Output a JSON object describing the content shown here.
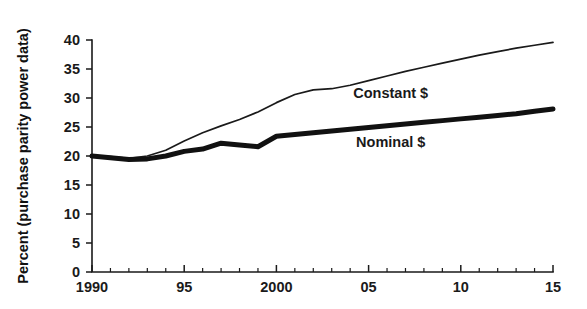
{
  "chart_data": {
    "type": "line",
    "title": "",
    "xlabel": "",
    "ylabel": "Percent (purchase parity power data)",
    "xlim": [
      1990,
      2015
    ],
    "ylim": [
      0,
      40
    ],
    "grid": false,
    "legend_position": "inline-annotation",
    "y_ticks": [
      0,
      5,
      10,
      15,
      20,
      25,
      30,
      35,
      40
    ],
    "y_tick_labels": [
      "0",
      "5",
      "10",
      "15",
      "20",
      "25",
      "30",
      "35",
      "40"
    ],
    "x_ticks": [
      1990,
      1995,
      2000,
      2005,
      2010,
      2015
    ],
    "x_tick_labels": [
      "1990",
      "95",
      "2000",
      "05",
      "10",
      "15"
    ],
    "x_minor_tick_step": 1,
    "x": [
      1990,
      1991,
      1992,
      1993,
      1994,
      1995,
      1996,
      1997,
      1998,
      1999,
      2000,
      2001,
      2002,
      2003,
      2004,
      2005,
      2006,
      2007,
      2008,
      2009,
      2010,
      2011,
      2012,
      2013,
      2014,
      2015
    ],
    "series": [
      {
        "name": "Constant $",
        "label": "Constant $",
        "style": "thin",
        "color": "#1a1a1a",
        "values": [
          20.0,
          19.9,
          19.6,
          20.0,
          21.0,
          22.6,
          24.0,
          25.2,
          26.3,
          27.6,
          29.2,
          30.6,
          31.4,
          31.6,
          32.2,
          33.0,
          33.8,
          34.6,
          35.3,
          36.0,
          36.7,
          37.4,
          38.0,
          38.6,
          39.1,
          39.6
        ]
      },
      {
        "name": "Nominal $",
        "label": "Nominal $",
        "style": "thick",
        "color": "#111111",
        "values": [
          20.0,
          19.7,
          19.4,
          19.5,
          20.0,
          20.8,
          21.2,
          22.2,
          21.9,
          21.6,
          23.4,
          23.7,
          24.0,
          24.3,
          24.6,
          24.9,
          25.2,
          25.5,
          25.8,
          26.1,
          26.4,
          26.7,
          27.0,
          27.3,
          27.7,
          28.1
        ]
      }
    ],
    "annotations": [
      {
        "text": "Constant $",
        "x": 2006.2,
        "y": 30.0
      },
      {
        "text": "Nominal $",
        "x": 2006.2,
        "y": 21.5
      }
    ]
  }
}
